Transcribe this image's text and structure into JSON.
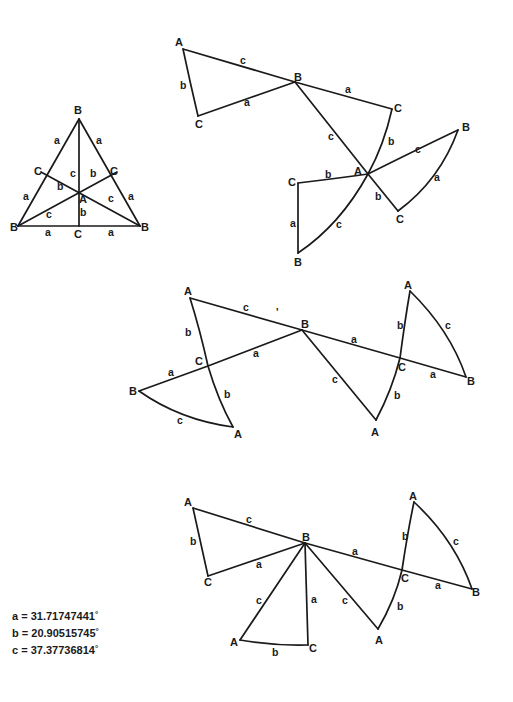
{
  "diagram": {
    "edge_color": "#1a1a1a",
    "figures": [
      {
        "name": "equilateral-triangle",
        "edges": [
          "M79,119 L18,226",
          "M79,119 L140,226",
          "M18,226 L140,226",
          "M79,119 L79,226",
          "M41,172 L140,226",
          "M117,172 L18,226"
        ],
        "vertices": [
          {
            "t": "B",
            "x": 74,
            "y": 114
          },
          {
            "t": "C",
            "x": 34,
            "y": 175
          },
          {
            "t": "C",
            "x": 110,
            "y": 175
          },
          {
            "t": "A",
            "x": 79,
            "y": 203
          },
          {
            "t": "B",
            "x": 10,
            "y": 231
          },
          {
            "t": "C",
            "x": 74,
            "y": 238
          },
          {
            "t": "B",
            "x": 141,
            "y": 231
          }
        ],
        "sides": [
          {
            "t": "a",
            "x": 54,
            "y": 144
          },
          {
            "t": "a",
            "x": 96,
            "y": 144
          },
          {
            "t": "c",
            "x": 70,
            "y": 177
          },
          {
            "t": "b",
            "x": 90,
            "y": 177
          },
          {
            "t": "b",
            "x": 57,
            "y": 190
          },
          {
            "t": "a",
            "x": 23,
            "y": 200
          },
          {
            "t": "c",
            "x": 108,
            "y": 202
          },
          {
            "t": "a",
            "x": 128,
            "y": 200
          },
          {
            "t": "c",
            "x": 46,
            "y": 218
          },
          {
            "t": "b",
            "x": 80,
            "y": 216
          },
          {
            "t": "a",
            "x": 45,
            "y": 236
          },
          {
            "t": "a",
            "x": 108,
            "y": 236
          }
        ]
      },
      {
        "name": "pinwheel-top",
        "edges": [
          "M183,49 L295,82",
          "M183,49 Q190,82 198,116",
          "M198,116 L295,82",
          "M295,82 L392,109",
          "M295,82 L368,174",
          "M392,109 Q384,145 368,174",
          "M368,174 Q420,148 458,130",
          "M458,130 Q440,180 398,211",
          "M368,174 L398,211",
          "M298,183 Q340,178 368,174",
          "M298,183 L298,253",
          "M298,253 Q340,225 368,174"
        ],
        "vertices": [
          {
            "t": "A",
            "x": 175,
            "y": 46
          },
          {
            "t": "B",
            "x": 294,
            "y": 81
          },
          {
            "t": "C",
            "x": 195,
            "y": 128
          },
          {
            "t": "C",
            "x": 394,
            "y": 112
          },
          {
            "t": "B",
            "x": 462,
            "y": 131
          },
          {
            "t": "A",
            "x": 354,
            "y": 175
          },
          {
            "t": "C",
            "x": 288,
            "y": 186
          },
          {
            "t": "C",
            "x": 396,
            "y": 223
          },
          {
            "t": "B",
            "x": 294,
            "y": 266
          }
        ],
        "sides": [
          {
            "t": "c",
            "x": 240,
            "y": 64
          },
          {
            "t": "b",
            "x": 180,
            "y": 89
          },
          {
            "t": "a",
            "x": 244,
            "y": 106
          },
          {
            "t": "a",
            "x": 345,
            "y": 93
          },
          {
            "t": "c",
            "x": 328,
            "y": 140
          },
          {
            "t": "b",
            "x": 388,
            "y": 145
          },
          {
            "t": "c",
            "x": 415,
            "y": 153
          },
          {
            "t": "b",
            "x": 325,
            "y": 178
          },
          {
            "t": "a",
            "x": 434,
            "y": 181
          },
          {
            "t": "b",
            "x": 375,
            "y": 200
          },
          {
            "t": "a",
            "x": 290,
            "y": 227
          },
          {
            "t": "c",
            "x": 336,
            "y": 228
          }
        ]
      },
      {
        "name": "strip-middle",
        "edges": [
          "M190,298 L302,330",
          "M190,298 Q200,330 208,366",
          "M208,366 L302,330",
          "M302,330 L400,358",
          "M400,358 L466,377",
          "M302,330 L376,420",
          "M376,420 Q392,390 400,358",
          "M400,358 Q405,320 410,291",
          "M410,291 Q450,330 466,377",
          "M208,366 L139,391",
          "M208,366 Q218,400 233,427",
          "M139,391 Q180,420 233,427"
        ],
        "vertices": [
          {
            "t": "A",
            "x": 184,
            "y": 295
          },
          {
            "t": "B",
            "x": 301,
            "y": 328
          },
          {
            "t": "A",
            "x": 404,
            "y": 289
          },
          {
            "t": "C",
            "x": 195,
            "y": 365
          },
          {
            "t": "C",
            "x": 398,
            "y": 371
          },
          {
            "t": "B",
            "x": 129,
            "y": 395
          },
          {
            "t": "B",
            "x": 467,
            "y": 385
          },
          {
            "t": "A",
            "x": 234,
            "y": 438
          },
          {
            "t": "A",
            "x": 371,
            "y": 436
          }
        ],
        "sides": [
          {
            "t": "c",
            "x": 243,
            "y": 311
          },
          {
            "t": "b",
            "x": 185,
            "y": 336
          },
          {
            "t": "a",
            "x": 351,
            "y": 343
          },
          {
            "t": "b",
            "x": 397,
            "y": 329
          },
          {
            "t": "c",
            "x": 445,
            "y": 329
          },
          {
            "t": "a",
            "x": 253,
            "y": 357
          },
          {
            "t": "a",
            "x": 168,
            "y": 376
          },
          {
            "t": "a",
            "x": 430,
            "y": 378
          },
          {
            "t": "c",
            "x": 332,
            "y": 383
          },
          {
            "t": "b",
            "x": 224,
            "y": 398
          },
          {
            "t": "b",
            "x": 394,
            "y": 399
          },
          {
            "t": "c",
            "x": 177,
            "y": 424
          }
        ]
      },
      {
        "name": "strip-bottom",
        "edges": [
          "M193,508 L305,543",
          "M193,508 Q200,540 208,576",
          "M208,576 L305,543",
          "M305,543 L402,570",
          "M402,570 L472,589",
          "M305,543 L240,640",
          "M240,640 Q275,646 308,645",
          "M305,543 L308,645",
          "M305,543 L378,629",
          "M378,629 Q395,600 402,570",
          "M402,570 Q408,530 414,502",
          "M414,502 Q455,540 472,589"
        ],
        "vertices": [
          {
            "t": "A",
            "x": 184,
            "y": 506
          },
          {
            "t": "B",
            "x": 302,
            "y": 541
          },
          {
            "t": "A",
            "x": 409,
            "y": 500
          },
          {
            "t": "C",
            "x": 204,
            "y": 586
          },
          {
            "t": "C",
            "x": 401,
            "y": 582
          },
          {
            "t": "B",
            "x": 472,
            "y": 596
          },
          {
            "t": "A",
            "x": 230,
            "y": 646
          },
          {
            "t": "C",
            "x": 309,
            "y": 652
          },
          {
            "t": "A",
            "x": 375,
            "y": 644
          }
        ],
        "sides": [
          {
            "t": "c",
            "x": 246,
            "y": 523
          },
          {
            "t": "b",
            "x": 190,
            "y": 545
          },
          {
            "t": "a",
            "x": 352,
            "y": 555
          },
          {
            "t": "b",
            "x": 402,
            "y": 540
          },
          {
            "t": "c",
            "x": 453,
            "y": 545
          },
          {
            "t": "a",
            "x": 256,
            "y": 568
          },
          {
            "t": "a",
            "x": 435,
            "y": 589
          },
          {
            "t": "c",
            "x": 256,
            "y": 604
          },
          {
            "t": "a",
            "x": 311,
            "y": 603
          },
          {
            "t": "c",
            "x": 342,
            "y": 604
          },
          {
            "t": "b",
            "x": 397,
            "y": 610
          },
          {
            "t": "b",
            "x": 272,
            "y": 656
          }
        ]
      }
    ]
  },
  "values": [
    {
      "label": "a",
      "eq": "=",
      "value": "31.71747441",
      "unit": "°"
    },
    {
      "label": "b",
      "eq": "=",
      "value": "20.90515745",
      "unit": "°"
    },
    {
      "label": "c",
      "eq": "=",
      "value": "37.37736814",
      "unit": "°"
    }
  ],
  "stray_mark": {
    "t": "'",
    "x": 276,
    "y": 316
  }
}
